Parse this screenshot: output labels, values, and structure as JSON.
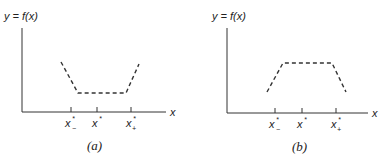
{
  "panels": [
    {
      "id": "a",
      "caption": "(a)",
      "y_label": "y = f(x)",
      "x_label": "x",
      "shape": "valley",
      "ticks": [
        {
          "base": "x",
          "sup": "*",
          "sub": "−"
        },
        {
          "base": "x",
          "sup": "*",
          "sub": ""
        },
        {
          "base": "x",
          "sup": "*",
          "sub": "+"
        }
      ]
    },
    {
      "id": "b",
      "caption": "(b)",
      "y_label": "y = f(x)",
      "x_label": "x",
      "shape": "plateau",
      "ticks": [
        {
          "base": "x",
          "sup": "*",
          "sub": "−"
        },
        {
          "base": "x",
          "sup": "*",
          "sub": ""
        },
        {
          "base": "x",
          "sup": "*",
          "sub": "+"
        }
      ]
    }
  ]
}
